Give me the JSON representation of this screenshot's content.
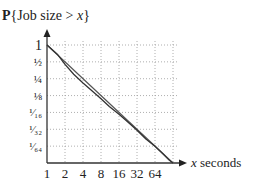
{
  "chart_data": {
    "type": "line",
    "title": "P{Job size > x}",
    "title_parts": {
      "bold": "P",
      "rest": "{Job size > ",
      "italic": "x",
      "close": "}"
    },
    "xlabel": "x seconds",
    "xlabel_parts": {
      "italic": "x",
      "rest": " seconds"
    },
    "ylabel": "",
    "x_scale": "log2",
    "y_scale": "log2",
    "x_ticks": [
      1,
      2,
      4,
      8,
      16,
      32,
      64
    ],
    "x_tick_labels": [
      "1",
      "2",
      "4",
      "8",
      "16",
      "32",
      "64"
    ],
    "y_ticks": [
      1,
      0.5,
      0.25,
      0.125,
      0.0625,
      0.03125,
      0.015625
    ],
    "y_tick_labels": [
      "1",
      "½",
      "¼",
      "⅛",
      "¹⁄₁₆",
      "¹⁄₃₂",
      "¹⁄₆₄"
    ],
    "xlim": [
      1,
      128
    ],
    "ylim": [
      0.0078125,
      1
    ],
    "grid": true,
    "series": [
      {
        "name": "reference",
        "x": [
          1,
          128
        ],
        "y": [
          1,
          0.0078125
        ]
      },
      {
        "name": "empirical",
        "x": [
          1,
          1.5,
          2,
          2.8,
          4,
          5.7,
          8,
          11,
          16,
          22,
          32,
          45,
          64,
          90,
          110,
          128
        ],
        "y": [
          1,
          0.68,
          0.45,
          0.3,
          0.21,
          0.15,
          0.11,
          0.08,
          0.058,
          0.043,
          0.03,
          0.021,
          0.0155,
          0.011,
          0.0088,
          0.0078125
        ]
      }
    ]
  }
}
